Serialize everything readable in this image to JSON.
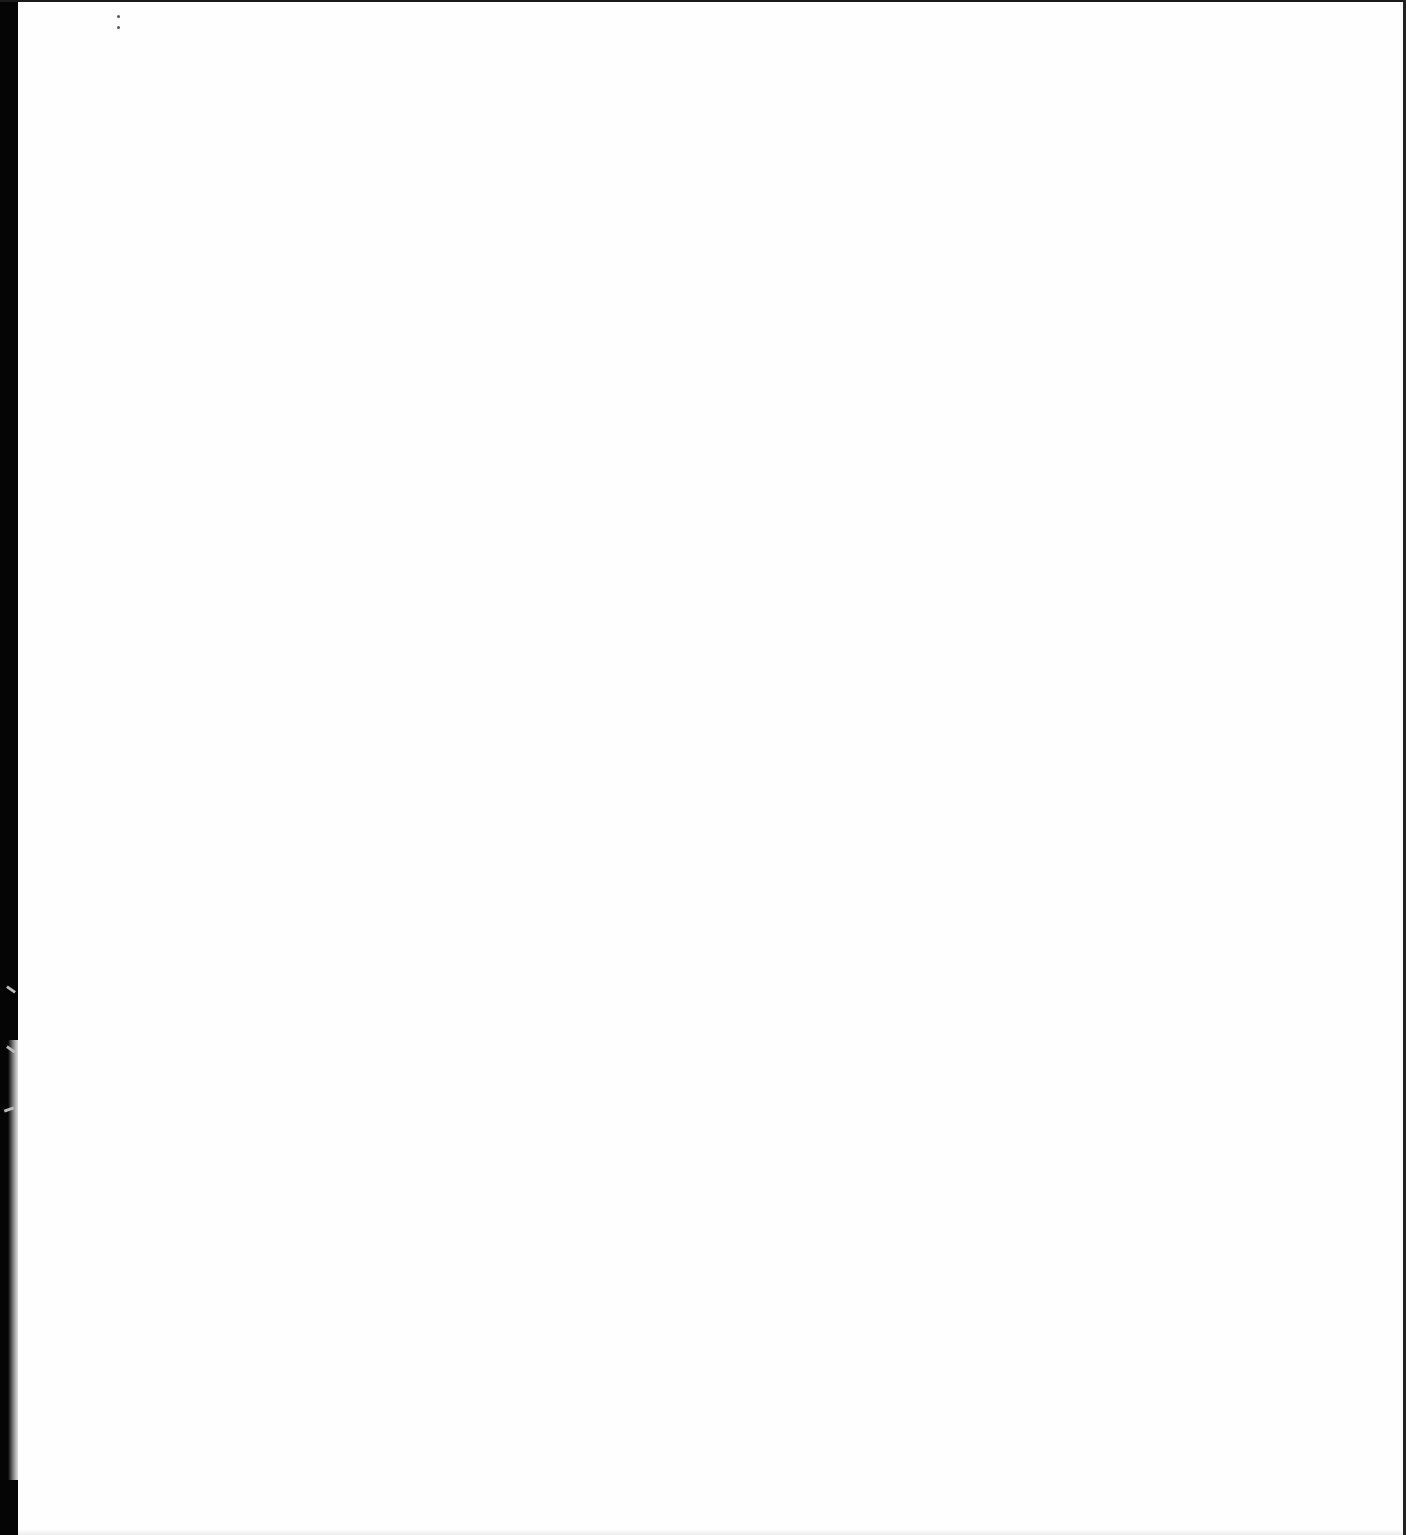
{
  "document": {
    "type": "scanned-page",
    "content": "",
    "colors": {
      "paper": "#ffffff",
      "binding_edge": "#050505",
      "border": "#1a1a1a",
      "speck": "#555555"
    },
    "marks": [
      {
        "name": "speck-1",
        "x": 118,
        "y": 16
      },
      {
        "name": "speck-2",
        "x": 118,
        "y": 27
      }
    ]
  }
}
